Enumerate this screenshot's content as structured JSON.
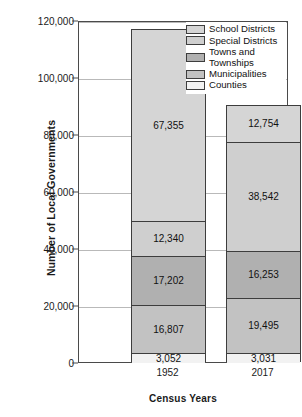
{
  "chart_data": {
    "type": "bar",
    "title": "",
    "subtitle": "",
    "xlabel": "Census Years",
    "ylabel": "Number of Local Governments",
    "categories": [
      "1952",
      "2017"
    ],
    "ylim": [
      0,
      120000
    ],
    "yticks": [
      "0",
      "20,000",
      "40,000",
      "60,000",
      "80,000",
      "100,000",
      "120,000"
    ],
    "ytick_values": [
      0,
      20000,
      40000,
      60000,
      80000,
      100000,
      120000
    ],
    "grid": true,
    "stacked": true,
    "legend_position": "top-right",
    "series": [
      {
        "name": "School Districts",
        "color": "#d5d5d5",
        "values": [
          67355,
          12754
        ],
        "labels": [
          "67,355",
          "12,754"
        ]
      },
      {
        "name": "Special Districts",
        "color": "#cfcfcf",
        "values": [
          12340,
          38542
        ],
        "labels": [
          "12,340",
          "38,542"
        ]
      },
      {
        "name": "Towns and\nTownships",
        "color": "#b0b0b0",
        "values": [
          17202,
          16253
        ],
        "labels": [
          "17,202",
          "16,253"
        ]
      },
      {
        "name": "Municipalities",
        "color": "#c2c2c2",
        "values": [
          16807,
          19495
        ],
        "labels": [
          "16,807",
          "19,495"
        ]
      },
      {
        "name": "Counties",
        "color": "#f2f2f2",
        "values": [
          3052,
          3031
        ],
        "labels": [
          "3,052",
          "3,031"
        ]
      }
    ],
    "totals": [
      116756,
      90075
    ]
  },
  "legend": {
    "items": [
      {
        "label": "School Districts"
      },
      {
        "label": "Special Districts"
      },
      {
        "label": "Towns and\nTownships"
      },
      {
        "label": "Municipalities"
      },
      {
        "label": "Counties"
      }
    ]
  },
  "axes": {
    "y_title": "Number of Local Governments",
    "x_title": "Census Years",
    "y_ticks": [
      "120,000",
      "100,000",
      "80,000",
      "60,000",
      "40,000",
      "20,000",
      "0"
    ],
    "x_ticks": [
      "1952",
      "2017"
    ]
  },
  "bar_1952": {
    "category": "1952",
    "school_districts": "67,355",
    "special_districts": "12,340",
    "towns_townships": "17,202",
    "municipalities": "16,807",
    "counties": "3,052"
  },
  "bar_2017": {
    "category": "2017",
    "school_districts": "12,754",
    "special_districts": "38,542",
    "towns_townships": "16,253",
    "municipalities": "19,495",
    "counties": "3,031"
  }
}
